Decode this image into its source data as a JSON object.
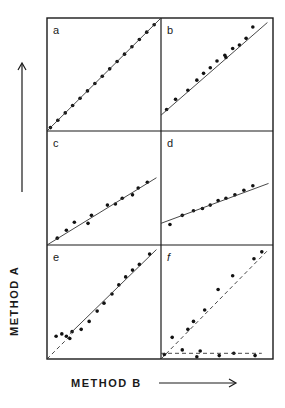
{
  "figure": {
    "y_axis_label": "METHOD  A",
    "x_axis_label": "METHOD B",
    "panel_labels": [
      "a",
      "b",
      "c",
      "d",
      "e",
      "f"
    ]
  },
  "chart_data": [
    {
      "type": "scatter",
      "panel": "a",
      "title": "a",
      "xlabel": "METHOD B",
      "ylabel": "METHOD A",
      "xlim": [
        0,
        100
      ],
      "ylim": [
        0,
        100
      ],
      "grid": false,
      "series": [
        {
          "name": "points",
          "x": [
            3,
            9.5,
            16,
            22.5,
            29,
            35.5,
            42,
            48.5,
            55,
            61.5,
            68,
            74.5,
            81,
            87.5,
            94
          ],
          "y": [
            3,
            9.5,
            16,
            22.5,
            29,
            35.5,
            42,
            48.5,
            55,
            61.5,
            68,
            74.5,
            81,
            87.5,
            94
          ]
        },
        {
          "name": "fit line",
          "style": "solid",
          "x": [
            0,
            100
          ],
          "y": [
            0,
            100
          ]
        }
      ]
    },
    {
      "type": "scatter",
      "panel": "b",
      "title": "b",
      "xlabel": "METHOD B",
      "ylabel": "METHOD A",
      "xlim": [
        0,
        100
      ],
      "ylim": [
        0,
        100
      ],
      "grid": false,
      "series": [
        {
          "name": "points",
          "x": [
            5,
            13,
            24,
            32,
            38,
            44,
            50,
            57,
            58,
            64,
            70,
            76,
            82
          ],
          "y": [
            19,
            28,
            36,
            45,
            51,
            56,
            62,
            67,
            65,
            73,
            76,
            82,
            92
          ]
        },
        {
          "name": "fit line",
          "style": "solid",
          "x": [
            0,
            95
          ],
          "y": [
            14,
            96
          ]
        }
      ]
    },
    {
      "type": "scatter",
      "panel": "c",
      "title": "c",
      "xlabel": "METHOD B",
      "ylabel": "METHOD A",
      "xlim": [
        0,
        100
      ],
      "ylim": [
        0,
        100
      ],
      "grid": false,
      "series": [
        {
          "name": "points",
          "x": [
            9,
            17,
            24,
            36,
            39,
            53,
            60,
            66,
            75,
            80,
            88
          ],
          "y": [
            6,
            13,
            20,
            19,
            26,
            35,
            36,
            41,
            44,
            50,
            55
          ]
        },
        {
          "name": "fit line",
          "style": "solid",
          "x": [
            0,
            96
          ],
          "y": [
            0,
            59
          ]
        }
      ]
    },
    {
      "type": "scatter",
      "panel": "d",
      "title": "d",
      "xlabel": "METHOD B",
      "ylabel": "METHOD A",
      "xlim": [
        0,
        100
      ],
      "ylim": [
        0,
        100
      ],
      "grid": false,
      "series": [
        {
          "name": "points",
          "x": [
            8,
            19,
            29,
            37,
            44,
            51,
            58,
            66,
            74,
            82
          ],
          "y": [
            18,
            26,
            30,
            32,
            35,
            39,
            41,
            44,
            48,
            52
          ]
        },
        {
          "name": "fit line",
          "style": "solid",
          "x": [
            0,
            96
          ],
          "y": [
            19,
            54
          ]
        }
      ]
    },
    {
      "type": "scatter",
      "panel": "e",
      "title": "e",
      "xlabel": "METHOD B",
      "ylabel": "METHOD A",
      "xlim": [
        0,
        100
      ],
      "ylim": [
        0,
        100
      ],
      "grid": false,
      "series": [
        {
          "name": "points",
          "x": [
            8,
            13,
            17,
            20,
            22,
            30,
            37,
            44,
            50,
            57,
            63,
            69,
            75,
            81,
            90
          ],
          "y": [
            20,
            22,
            20,
            18,
            24,
            26,
            33,
            42,
            49,
            57,
            65,
            72,
            78,
            83,
            92
          ]
        },
        {
          "name": "fit line (solid)",
          "style": "solid",
          "x": [
            20,
            96
          ],
          "y": [
            22,
            96
          ]
        },
        {
          "name": "line of identity (dashed)",
          "style": "dashed",
          "x": [
            0,
            22
          ],
          "y": [
            0,
            22
          ]
        }
      ]
    },
    {
      "type": "scatter",
      "panel": "f",
      "title": "f",
      "xlabel": "METHOD B",
      "ylabel": "METHOD A",
      "xlim": [
        0,
        100
      ],
      "ylim": [
        0,
        100
      ],
      "grid": false,
      "series": [
        {
          "name": "upper points",
          "x": [
            10,
            24,
            29,
            39,
            51,
            64,
            83,
            90
          ],
          "y": [
            19,
            26,
            33,
            43,
            61,
            73,
            88,
            94
          ]
        },
        {
          "name": "lower points",
          "x": [
            3,
            19,
            32,
            35,
            52,
            65,
            84
          ],
          "y": [
            4,
            8,
            2,
            7,
            3,
            5,
            3
          ]
        },
        {
          "name": "diagonal (dashed)",
          "style": "dashed",
          "x": [
            0,
            96
          ],
          "y": [
            0,
            96
          ]
        },
        {
          "name": "horizontal (dashed)",
          "style": "dashed",
          "x": [
            0,
            90
          ],
          "y": [
            5,
            5
          ]
        }
      ]
    }
  ]
}
